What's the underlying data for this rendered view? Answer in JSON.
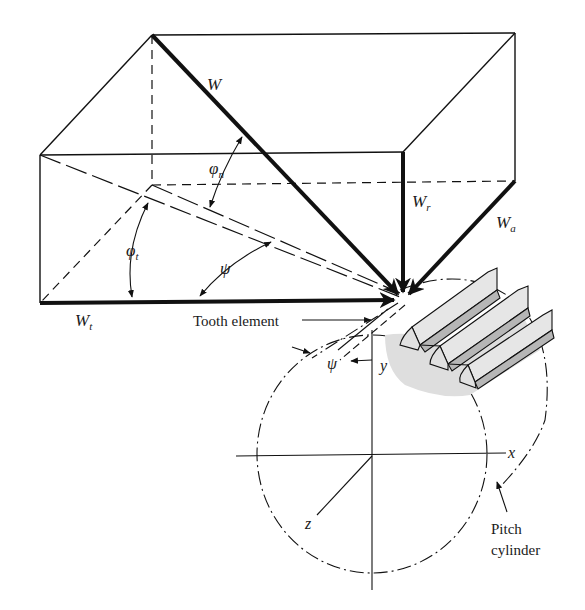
{
  "figure": {
    "type": "helical gear tooth force components",
    "colors": {
      "ink": "#111111",
      "background": "#ffffff",
      "tooth_fill": "#b4b4b4",
      "tooth_light": "#e2e2e2",
      "shadow": "#dcdcdc"
    }
  },
  "labels": {
    "W": "W",
    "Wr_main": "W",
    "Wr_sub": "r",
    "Wa_main": "W",
    "Wa_sub": "a",
    "Wt_main": "W",
    "Wt_sub": "t",
    "phi_n_main": "φ",
    "phi_n_sub": "n",
    "phi_t_main": "φ",
    "phi_t_sub": "t",
    "psi_upper": "ψ",
    "psi_lower": "ψ",
    "tooth_element": "Tooth element",
    "y_axis": "y",
    "x_axis": "x",
    "z_axis": "z",
    "pitch_line1": "Pitch",
    "pitch_line2": "cylinder"
  }
}
